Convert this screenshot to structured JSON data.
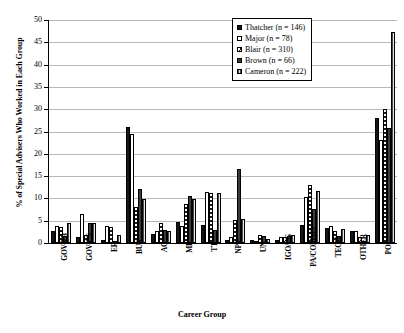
{
  "chart_data": {
    "type": "bar",
    "title": "",
    "xlabel": "Career Group",
    "ylabel": "% of Special Advisers Who Worked in Each Group",
    "ylim": [
      0,
      50
    ],
    "ytick_step": 5,
    "ytick_labels": [
      "0",
      "5",
      "10",
      "15",
      "20",
      "25",
      "30",
      "35",
      "40",
      "45",
      "50"
    ],
    "grid": true,
    "legend_position": "top-right",
    "categories": [
      "GOV-PB",
      "GOV-CS",
      "ER",
      "BUS",
      "AC",
      "ME",
      "TT",
      "NPS",
      "UN",
      "IGO/FG",
      "PA/COMMS",
      "TECH",
      "OTHER",
      "POL"
    ],
    "series": [
      {
        "name": "Thatcher (n = 146)",
        "pattern": "solid-black",
        "values": [
          2.7,
          1.4,
          0.7,
          26.0,
          2.1,
          4.8,
          4.1,
          0.7,
          0.7,
          0.7,
          4.1,
          3.4,
          2.7,
          28.1
        ]
      },
      {
        "name": "Major (n = 78)",
        "pattern": "white",
        "values": [
          3.8,
          6.4,
          3.8,
          24.4,
          2.6,
          3.8,
          11.5,
          1.3,
          0.0,
          1.3,
          10.3,
          3.8,
          2.6,
          23.1
        ]
      },
      {
        "name": "Blair (n = 310)",
        "pattern": "checkered",
        "values": [
          3.5,
          1.9,
          3.5,
          8.1,
          4.5,
          8.7,
          11.3,
          5.2,
          1.9,
          1.3,
          12.9,
          2.6,
          1.3,
          30.0
        ]
      },
      {
        "name": "Brown (n = 66)",
        "pattern": "dark-gray",
        "values": [
          1.5,
          4.5,
          0.0,
          12.1,
          3.0,
          10.6,
          3.0,
          16.7,
          1.5,
          1.5,
          7.6,
          1.5,
          0.0,
          25.8
        ]
      },
      {
        "name": "Cameron (n = 222)",
        "pattern": "striped",
        "values": [
          4.5,
          4.5,
          1.8,
          9.9,
          2.7,
          9.9,
          11.3,
          5.4,
          0.9,
          1.8,
          11.7,
          3.2,
          1.8,
          47.3
        ]
      }
    ]
  }
}
